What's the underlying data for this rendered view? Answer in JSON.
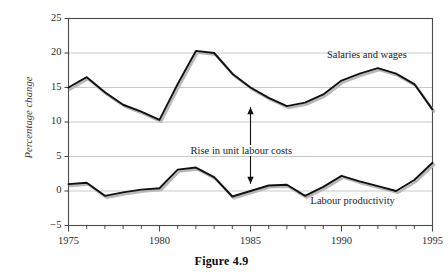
{
  "figure": {
    "caption": "Figure 4.9"
  },
  "axes": {
    "y_title": "Percentage change",
    "y_ticks": [
      "25",
      "20",
      "15",
      "10",
      "5",
      "0",
      "−5"
    ],
    "x_ticks": [
      "1975",
      "1980",
      "1985",
      "1990",
      "1995"
    ]
  },
  "labels": {
    "series_top": "Salaries and wages",
    "series_bottom": "Labour productivity",
    "annotation": "Rise in unit labour costs"
  },
  "colors": {
    "line": "#111111",
    "shadow": "#b9b9b9",
    "grid": "#c9c9c9",
    "frame": "#4a4a4a",
    "text": "#1d1d1d"
  },
  "chart_data": {
    "type": "line",
    "title": "Figure 4.9",
    "xlabel": "",
    "ylabel": "Percentage change",
    "xlim": [
      1975,
      1995
    ],
    "ylim": [
      -5,
      25
    ],
    "ytick_values": [
      25,
      20,
      15,
      10,
      5,
      0,
      -5
    ],
    "xtick_values": [
      1975,
      1980,
      1985,
      1990,
      1995
    ],
    "x_minor_tick_step": 1,
    "grid": "horizontal",
    "legend": "inline-labels",
    "x": [
      1975,
      1976,
      1977,
      1978,
      1979,
      1980,
      1981,
      1982,
      1983,
      1984,
      1985,
      1986,
      1987,
      1988,
      1989,
      1990,
      1991,
      1992,
      1993,
      1994,
      1995
    ],
    "series": [
      {
        "name": "Salaries and wages",
        "values": [
          15.0,
          16.5,
          14.3,
          12.5,
          11.5,
          10.3,
          15.5,
          20.3,
          20.0,
          17.0,
          15.0,
          13.5,
          12.3,
          12.8,
          14.0,
          16.0,
          17.0,
          17.8,
          17.0,
          15.5,
          11.8
        ]
      },
      {
        "name": "Labour productivity",
        "values": [
          1.0,
          1.2,
          -0.7,
          -0.2,
          0.2,
          0.4,
          3.1,
          3.4,
          2.0,
          -0.8,
          0.0,
          0.8,
          0.9,
          -0.7,
          0.6,
          2.2,
          1.4,
          0.7,
          0.0,
          1.6,
          4.1
        ]
      }
    ],
    "annotations": [
      {
        "text": "Rise in unit labour costs",
        "x": 1985,
        "y_from": 0.9,
        "y_to": 12.3,
        "type": "double-headed-vertical-arrow"
      }
    ]
  }
}
